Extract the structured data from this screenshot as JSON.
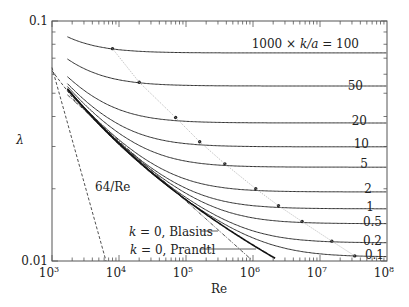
{
  "chart_data": {
    "type": "line",
    "title": "",
    "xlabel": "Re",
    "ylabel": "λ",
    "xscale": "log",
    "yscale": "log",
    "xlim": [
      1000,
      100000000
    ],
    "ylim": [
      0.01,
      0.1
    ],
    "x_tick_labels": [
      "10^3",
      "10^4",
      "10^5",
      "10^6",
      "10^7",
      "10^8"
    ],
    "y_tick_labels": [
      "0.01",
      "0.1"
    ],
    "grid": false,
    "legend_title": "1000 × k/a",
    "series": [
      {
        "name": "100",
        "label": "1000 × k/a = 100",
        "re_start": 1700,
        "lambda_start": 0.089,
        "lambda_asymptote": 0.0736,
        "dot": {
          "re": 8000,
          "lambda": 0.0767
        }
      },
      {
        "name": "50",
        "label": "50",
        "re_start": 1700,
        "lambda_start": 0.072,
        "lambda_asymptote": 0.0536,
        "dot": {
          "re": 20000,
          "lambda": 0.0556
        }
      },
      {
        "name": "20",
        "label": "20",
        "re_start": 1700,
        "lambda_start": 0.061,
        "lambda_asymptote": 0.0376,
        "dot": {
          "re": 70000,
          "lambda": 0.0396
        }
      },
      {
        "name": "10",
        "label": "10",
        "re_start": 1700,
        "lambda_start": 0.057,
        "lambda_asymptote": 0.0299,
        "dot": {
          "re": 160000,
          "lambda": 0.0314
        }
      },
      {
        "name": "5",
        "label": "5",
        "re_start": 1700,
        "lambda_start": 0.054,
        "lambda_asymptote": 0.0246,
        "dot": {
          "re": 380000,
          "lambda": 0.0254
        }
      },
      {
        "name": "2",
        "label": "2",
        "re_start": 1700,
        "lambda_start": 0.053,
        "lambda_asymptote": 0.0194,
        "dot": {
          "re": 1100000,
          "lambda": 0.02
        }
      },
      {
        "name": "1",
        "label": "1",
        "re_start": 1700,
        "lambda_start": 0.052,
        "lambda_asymptote": 0.0165,
        "dot": {
          "re": 2400000,
          "lambda": 0.017
        }
      },
      {
        "name": "0.5",
        "label": "0.5",
        "re_start": 1700,
        "lambda_start": 0.052,
        "lambda_asymptote": 0.0143,
        "dot": {
          "re": 5400000,
          "lambda": 0.0146
        }
      },
      {
        "name": "0.2",
        "label": "0.2",
        "re_start": 1700,
        "lambda_start": 0.052,
        "lambda_asymptote": 0.0119,
        "dot": {
          "re": 15000000,
          "lambda": 0.0121
        }
      },
      {
        "name": "0.1",
        "label": "0.1",
        "re_start": 1700,
        "lambda_start": 0.052,
        "lambda_asymptote": 0.0104,
        "dot": {
          "re": 33000000,
          "lambda": 0.0105
        }
      }
    ],
    "reference_lines": [
      {
        "name": "64/Re",
        "label": "64/Re",
        "style": "dashed",
        "formula": "lambda = 64/Re",
        "re_range": [
          1000,
          6400
        ]
      },
      {
        "name": "k=0 Blasius",
        "label": "k = 0, Blasius",
        "style": "dash-dot",
        "formula": "lambda = 0.316 Re^-0.25",
        "re_range": [
          1700,
          1000000
        ]
      },
      {
        "name": "k=0 Prandtl",
        "label": "k = 0, Prandtl",
        "style": "solid-thin",
        "formula": "1/sqrt(lambda) = 2 log10(Re sqrt(lambda)) - 0.8",
        "re_range": [
          1700,
          2000000
        ]
      },
      {
        "name": "transition boundary",
        "label": "",
        "style": "dotted-gray",
        "description": "locus of dots marking onset of fully rough regime"
      }
    ],
    "annotations": [
      "1000 × k/a = 100",
      "50",
      "20",
      "10",
      "5",
      "2",
      "1",
      "0.5",
      "0.2",
      "0.1",
      "64/Re",
      "k = 0, Blasius",
      "k = 0, Prandtl"
    ]
  }
}
